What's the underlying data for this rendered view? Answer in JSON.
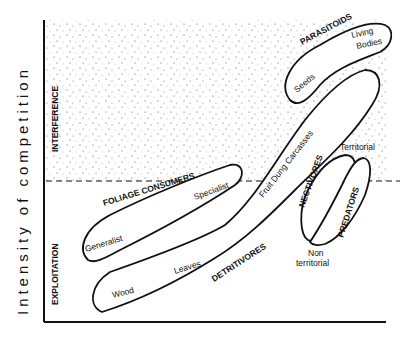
{
  "diagram": {
    "y_axis_label": "Intensity of competition",
    "regions": {
      "upper": "INTERFERENCE",
      "lower": "EXPLOITATION"
    },
    "groups": {
      "parasitoids": {
        "title": "PARASITOIDS",
        "items": [
          "Living",
          "Bodies",
          "Seeds"
        ]
      },
      "foliage": {
        "title": "FOLIAGE CONSUMERS",
        "items": [
          "Generalist",
          "Specialist"
        ]
      },
      "detritivores": {
        "title": "DETRITIVORES",
        "items": [
          "Wood",
          "Leaves",
          "Fruit Dung Carcasses"
        ]
      },
      "nectivores": {
        "title": "NECTIVORES"
      },
      "predators": {
        "title": "PREDATORS",
        "items": [
          "Territorial",
          "Non",
          "territorial"
        ]
      }
    },
    "colors": {
      "ink": "#111111",
      "background": "#ffffff",
      "stipple": "#555555"
    }
  }
}
